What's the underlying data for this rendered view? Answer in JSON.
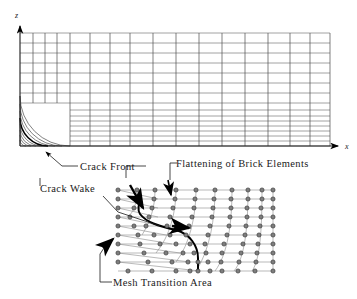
{
  "figure": {
    "type": "finite-element-mesh-diagram",
    "title_visible": false
  },
  "axes": {
    "z_label": "z",
    "x_label": "x"
  },
  "annotations": [
    {
      "id": "crack-front",
      "text": "Crack Front"
    },
    {
      "id": "crack-wake",
      "text": "Crack Wake"
    },
    {
      "id": "flattening",
      "text": "Flattening of Brick Elements"
    },
    {
      "id": "mesh-transition",
      "text": "Mesh Transition Area"
    }
  ],
  "colors": {
    "line": "#6b6b6b",
    "bold_line": "#000000",
    "node_fill": "#7a7a7a",
    "node_stroke": "#2b2b2b",
    "text": "#1a1a1a",
    "background": "#ffffff"
  },
  "top_mesh": {
    "description": "Rectangular global mesh with focused circular arcs at crack tip (origin)",
    "x_gridlines": [
      20,
      33,
      45,
      57,
      70,
      90,
      110,
      130,
      153,
      176,
      199,
      222,
      245,
      268,
      290,
      310,
      330
    ],
    "z_gridlines": [
      33,
      43,
      53,
      63,
      73,
      83,
      93,
      103,
      110,
      116,
      121,
      126,
      131,
      136,
      141,
      146
    ],
    "arc_radii": [
      6,
      11,
      16,
      22,
      28,
      35,
      42,
      50
    ],
    "bold_arc_radius": 28,
    "origin": {
      "x": 20,
      "y": 146
    }
  },
  "detail_mesh": {
    "description": "Zoomed mesh transition region: collapsed wedge elements at crack front fanning into brick elements",
    "left": 118,
    "right": 273,
    "top": 190,
    "bottom": 271,
    "rows": 9,
    "columns": 10,
    "bold_curve_label": "crack front trace"
  },
  "arrow_markers": [
    {
      "id": "crack-front-arrow",
      "target": "bold arc in top mesh"
    },
    {
      "id": "flattening-arrow-1",
      "target": "collapsed element row"
    },
    {
      "id": "flattening-arrow-2",
      "target": "collapsed element row"
    },
    {
      "id": "crack-wake-arrow",
      "target": "bold curve in detail mesh"
    },
    {
      "id": "mesh-transition-arrow",
      "target": "left fan of detail mesh"
    }
  ]
}
